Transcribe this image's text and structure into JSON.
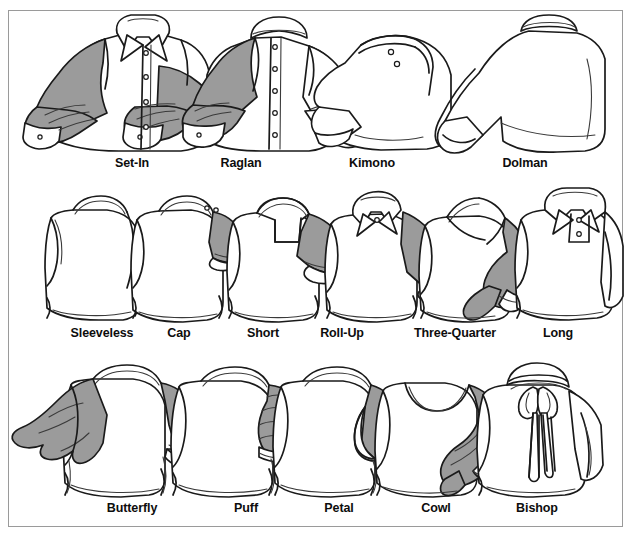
{
  "figure": {
    "kind": "illustrated-reference-chart",
    "frame_border_color": "#9a9a9a",
    "background_color": "#ffffff",
    "ink_color": "#1a1a1a",
    "shade_color": "#9b9b9b"
  },
  "rows": [
    {
      "name": "set-in-raglan-kimono-dolman",
      "items": [
        {
          "label": "Set-In",
          "label_x": 123,
          "icon": "shirt-set-in-sleeve-icon"
        },
        {
          "label": "Raglan",
          "label_x": 232,
          "icon": "shirt-raglan-sleeve-icon"
        },
        {
          "label": "Kimono",
          "label_x": 363,
          "icon": "shirt-kimono-sleeve-icon"
        },
        {
          "label": "Dolman",
          "label_x": 516,
          "icon": "shirt-dolman-sleeve-icon"
        }
      ]
    },
    {
      "name": "sleeveless-cap-short-rollup-threequarter-long",
      "items": [
        {
          "label": "Sleeveless",
          "label_x": 93,
          "icon": "shirt-sleeveless-icon"
        },
        {
          "label": "Cap",
          "label_x": 170,
          "icon": "shirt-cap-sleeve-icon"
        },
        {
          "label": "Short",
          "label_x": 254,
          "icon": "shirt-short-sleeve-icon"
        },
        {
          "label": "Roll-Up",
          "label_x": 333,
          "icon": "shirt-roll-up-sleeve-icon"
        },
        {
          "label": "Three-Quarter",
          "label_x": 446,
          "icon": "shirt-three-quarter-sleeve-icon"
        },
        {
          "label": "Long",
          "label_x": 549,
          "icon": "shirt-long-sleeve-icon"
        }
      ]
    },
    {
      "name": "butterfly-puff-petal-cowl-bishop",
      "items": [
        {
          "label": "Butterfly",
          "label_x": 123,
          "icon": "shirt-butterfly-sleeve-icon"
        },
        {
          "label": "Puff",
          "label_x": 237,
          "icon": "shirt-puff-sleeve-icon"
        },
        {
          "label": "Petal",
          "label_x": 330,
          "icon": "shirt-petal-sleeve-icon"
        },
        {
          "label": "Cowl",
          "label_x": 427,
          "icon": "shirt-cowl-sleeve-icon"
        },
        {
          "label": "Bishop",
          "label_x": 528,
          "icon": "shirt-bishop-sleeve-icon"
        }
      ]
    }
  ]
}
